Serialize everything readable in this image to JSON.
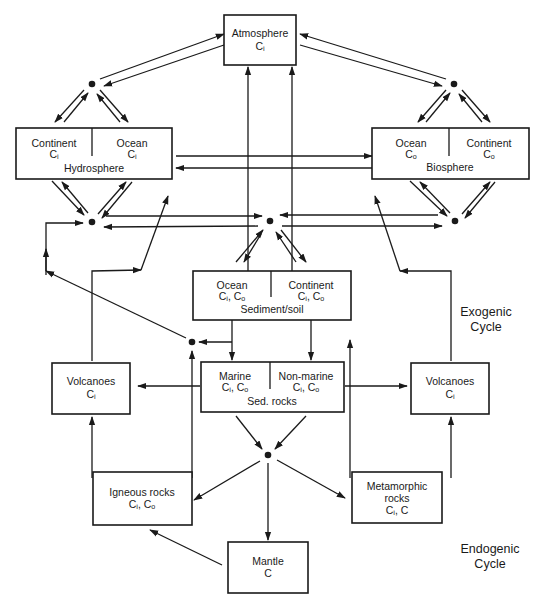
{
  "diagram": {
    "atmosphere": {
      "title": "Atmosphere",
      "carbon": "Cᵢ"
    },
    "hydrosphere": {
      "title": "Hydrosphere",
      "left": {
        "label": "Continent",
        "carbon": "Cᵢ"
      },
      "right": {
        "label": "Ocean",
        "carbon": "Cᵢ"
      }
    },
    "biosphere": {
      "title": "Biosphere",
      "left": {
        "label": "Ocean",
        "carbon": "Cₒ"
      },
      "right": {
        "label": "Continent",
        "carbon": "Cₒ"
      }
    },
    "sediment_soil": {
      "title": "Sediment/soil",
      "left": {
        "label": "Ocean",
        "carbon": "Cᵢ, Cₒ"
      },
      "right": {
        "label": "Continent",
        "carbon": "Cᵢ, Cₒ"
      }
    },
    "sed_rocks": {
      "title": "Sed. rocks",
      "left": {
        "label": "Marine",
        "carbon": "Cᵢ, Cₒ"
      },
      "right": {
        "label": "Non-marine",
        "carbon": "Cᵢ, Cₒ"
      }
    },
    "volcanoes_left": {
      "title": "Volcanoes",
      "carbon": "Cᵢ"
    },
    "volcanoes_right": {
      "title": "Volcanoes",
      "carbon": "Cᵢ"
    },
    "igneous_rocks": {
      "title": "Igneous rocks",
      "carbon": "Cᵢ, Cₒ"
    },
    "metamorphic_rocks": {
      "title_line1": "Metamorphic",
      "title_line2": "rocks",
      "carbon": "Cᵢ, C"
    },
    "mantle": {
      "title": "Mantle",
      "carbon": "C"
    },
    "labels": {
      "exogenic_line1": "Exogenic",
      "exogenic_line2": "Cycle",
      "endogenic_line1": "Endogenic",
      "endogenic_line2": "Cycle"
    }
  }
}
